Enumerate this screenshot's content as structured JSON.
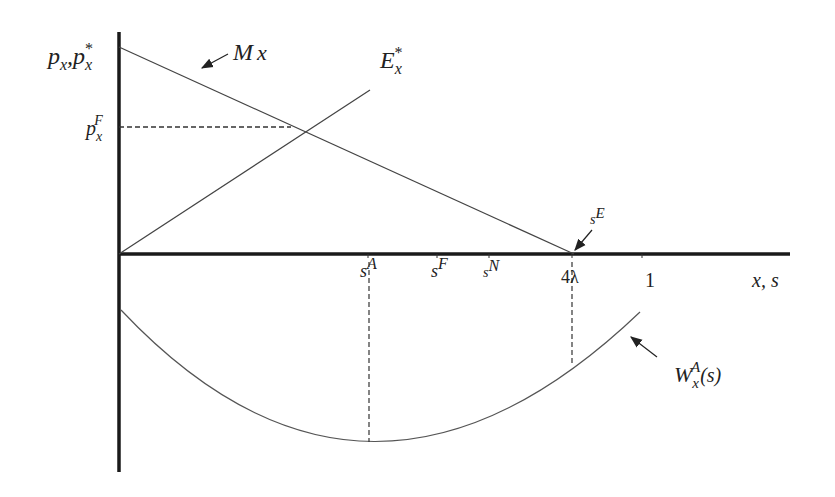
{
  "diagram": {
    "axes": {
      "y_label": {
        "base1": "p",
        "sub1": "x",
        "sep": ",",
        "base2": "p",
        "sub2": "x",
        "sup2": "*"
      },
      "x_label": "x, s"
    },
    "curves": {
      "M": {
        "base": "M",
        "sub": "x"
      },
      "E": {
        "base": "E",
        "sub": "x",
        "sup": "*"
      },
      "W": {
        "base": "W",
        "sub": "x",
        "sup": "A",
        "arg": "(s)"
      }
    },
    "price_level": {
      "base": "p",
      "sub": "x",
      "sup": "F"
    },
    "x_ticks": [
      {
        "base": "s",
        "sup": "A"
      },
      {
        "base": "s",
        "sup": "F"
      },
      {
        "base": "s",
        "sup": "N"
      },
      {
        "text": "4λ"
      },
      {
        "text": "1"
      }
    ],
    "point_label": {
      "base": "s",
      "sup": "E"
    },
    "colors": {
      "axis": "#1a1a1a",
      "line": "#444444"
    }
  }
}
